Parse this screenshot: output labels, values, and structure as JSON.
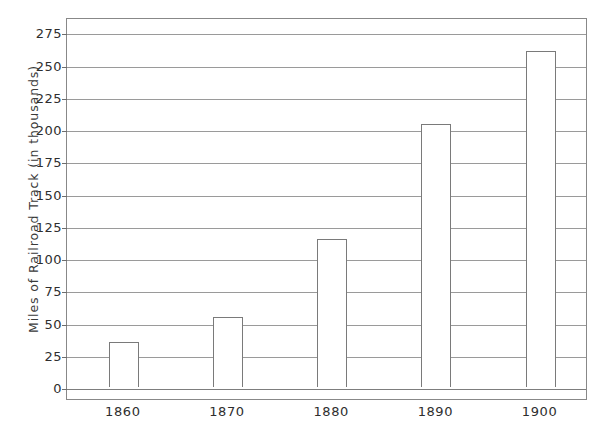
{
  "chart_data": {
    "type": "bar",
    "title": "",
    "subtitle": "",
    "xlabel": "",
    "ylabel": "Miles of Railroad Track (in thousands)",
    "categories": [
      "1860",
      "1870",
      "1880",
      "1890",
      "1900"
    ],
    "values": [
      35,
      54,
      115,
      204,
      261
    ],
    "series": [
      {
        "name": "Miles of Railroad Track",
        "values": [
          35,
          54,
          115,
          204,
          261
        ]
      }
    ],
    "ylim": [
      0,
      287
    ],
    "yticks": [
      0,
      25,
      50,
      75,
      100,
      125,
      150,
      175,
      200,
      225,
      250,
      275
    ],
    "ytick_labels": [
      "0",
      "25",
      "50",
      "75",
      "100",
      "125",
      "150",
      "175",
      "200",
      "225",
      "250",
      "275"
    ],
    "xtick_labels": [
      "1860",
      "1870",
      "1880",
      "1890",
      "1900"
    ],
    "grid": true,
    "grid_axis": "y",
    "legend": false,
    "legend_position": "none",
    "annotations": [],
    "bar_fill_color": "#ffffff",
    "bar_edge_color": "#7a7a7a",
    "gridline_color": "#9a9a9a",
    "axis_color": "#888888",
    "background_color": "#ffffff",
    "text_color": "#2e2e2e"
  },
  "axes": {
    "y_title": "Miles of Railroad Track (in thousands)",
    "ticks": [
      {
        "value": 275,
        "label": "275"
      },
      {
        "value": 250,
        "label": "250"
      },
      {
        "value": 225,
        "label": "225"
      },
      {
        "value": 200,
        "label": "200"
      },
      {
        "value": 175,
        "label": "175"
      },
      {
        "value": 150,
        "label": "150"
      },
      {
        "value": 125,
        "label": "125"
      },
      {
        "value": 100,
        "label": "100"
      },
      {
        "value": 75,
        "label": "75"
      },
      {
        "value": 50,
        "label": "50"
      },
      {
        "value": 25,
        "label": "25"
      },
      {
        "value": 0,
        "label": "0"
      }
    ],
    "x_labels": [
      {
        "label": "1860"
      },
      {
        "label": "1870"
      },
      {
        "label": "1880"
      },
      {
        "label": "1890"
      },
      {
        "label": "1900"
      }
    ]
  },
  "bars": [
    {
      "category": "1860",
      "value": 35
    },
    {
      "category": "1870",
      "value": 54
    },
    {
      "category": "1880",
      "value": 115
    },
    {
      "category": "1890",
      "value": 204
    },
    {
      "category": "1900",
      "value": 261
    }
  ]
}
